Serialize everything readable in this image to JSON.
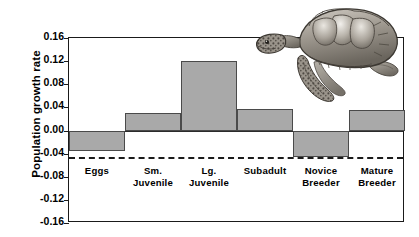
{
  "chart_data": {
    "type": "bar",
    "title": "",
    "subtitle": "",
    "xlabel": "",
    "ylabel": "Population growth rate",
    "categories": [
      "Eggs",
      "Sm. Juvenile",
      "Lg. Juvenile",
      "Subadult",
      "Novice Breeder",
      "Mature Breeder"
    ],
    "values": [
      -0.035,
      0.03,
      0.12,
      0.037,
      -0.045,
      0.035
    ],
    "ylim": [
      -0.16,
      0.16
    ],
    "ytick_labels": [
      "0.16",
      "0.12",
      "0.08",
      "0.04",
      "0.00",
      "-0.04",
      "-0.08",
      "-0.12",
      "-0.16"
    ],
    "ytick_values": [
      0.16,
      0.12,
      0.08,
      0.04,
      0.0,
      -0.04,
      -0.08,
      -0.12,
      -0.16
    ],
    "grid": false,
    "legend": null,
    "bar_color": "#a9a9a9",
    "bar_edge_color": "#4a4a4a",
    "axis_color": "#1a1a1a",
    "zero_line": 0.0,
    "threshold_line": -0.045,
    "threshold_style": "dashed",
    "annotations": [
      "sea-turtle-illustration"
    ]
  },
  "labels": {
    "category_lines": [
      [
        "Eggs"
      ],
      [
        "Sm.",
        "Juvenile"
      ],
      [
        "Lg.",
        "Juvenile"
      ],
      [
        "Subadult"
      ],
      [
        "Novice",
        "Breeder"
      ],
      [
        "Mature",
        "Breeder"
      ]
    ]
  }
}
